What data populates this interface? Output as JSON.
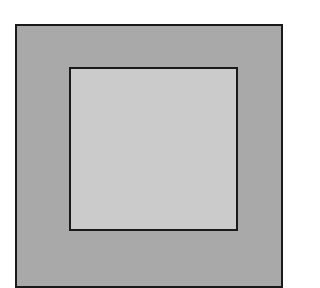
{
  "diagram": {
    "shapes": [
      {
        "name": "outer-square",
        "fill": "#a9a9a9",
        "stroke": "#1a1a1a"
      },
      {
        "name": "inner-square",
        "fill": "#cbcbcb",
        "stroke": "#1a1a1a"
      }
    ]
  }
}
